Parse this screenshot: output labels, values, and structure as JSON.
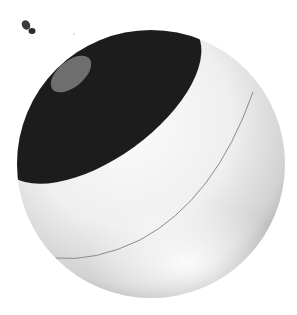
{
  "scene": {
    "description": "3D rendered white spherical camera with dark lens cap",
    "colors": {
      "background": "#ffffff",
      "sphere_light": "#f4f4f4",
      "sphere_shadow": "#b8b8b8",
      "cap_dark": "#1c1c1c",
      "lens_grey": "#6e6e6e",
      "seam": "#8a8a8a",
      "speck": "#3a3a3a"
    }
  }
}
